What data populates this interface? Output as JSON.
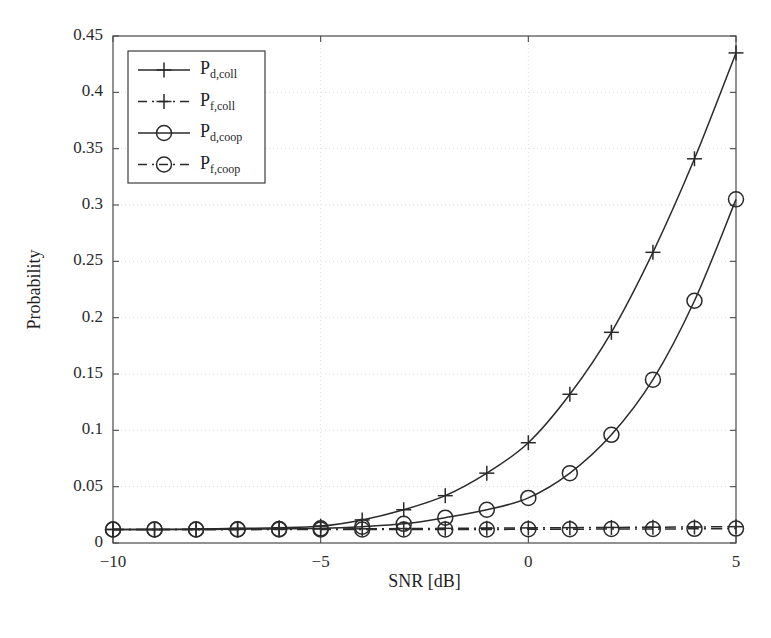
{
  "chart_data": {
    "type": "line",
    "title": "",
    "xlabel": "SNR [dB]",
    "ylabel": "Probability",
    "xlim": [
      -10,
      5
    ],
    "ylim": [
      0,
      0.45
    ],
    "grid": true,
    "legend_position": "top-left",
    "x": [
      -10,
      -9,
      -8,
      -7,
      -6,
      -5,
      -4,
      -3,
      -2,
      -1,
      0,
      1,
      2,
      3,
      4,
      5
    ],
    "xticks": [
      -10,
      -5,
      0,
      5
    ],
    "xticklabels": [
      "−10",
      "−5",
      "0",
      "5"
    ],
    "yticks": [
      0,
      0.05,
      0.1,
      0.15,
      0.2,
      0.25,
      0.3,
      0.35,
      0.4,
      0.45
    ],
    "yticklabels": [
      "0",
      "0.05",
      "0.1",
      "0.15",
      "0.2",
      "0.25",
      "0.3",
      "0.35",
      "0.4",
      "0.45"
    ],
    "series": [
      {
        "name": "P_d,coll",
        "label_base": "P",
        "label_sub": "d,coll",
        "marker": "plus",
        "linestyle": "solid",
        "color": "#2a2a2a",
        "values": [
          0.012,
          0.012,
          0.0125,
          0.013,
          0.0135,
          0.015,
          0.0205,
          0.0295,
          0.042,
          0.062,
          0.089,
          0.132,
          0.187,
          0.258,
          0.341,
          0.435
        ]
      },
      {
        "name": "P_f,coll",
        "label_base": "P",
        "label_sub": "f,coll",
        "marker": "plus",
        "linestyle": "dashdot",
        "color": "#2a2a2a",
        "values": [
          0.012,
          0.012,
          0.012,
          0.012,
          0.0122,
          0.0124,
          0.0126,
          0.0128,
          0.013,
          0.0132,
          0.0134,
          0.0136,
          0.0138,
          0.014,
          0.0142,
          0.0145
        ]
      },
      {
        "name": "P_d,coop",
        "label_base": "P",
        "label_sub": "d,coop",
        "marker": "circle",
        "linestyle": "solid",
        "color": "#2a2a2a",
        "values": [
          0.012,
          0.012,
          0.012,
          0.0122,
          0.0125,
          0.013,
          0.0145,
          0.017,
          0.0225,
          0.0295,
          0.04,
          0.062,
          0.096,
          0.145,
          0.215,
          0.305
        ]
      },
      {
        "name": "P_f,coop",
        "label_base": "P",
        "label_sub": "f,coop",
        "marker": "circle",
        "linestyle": "dashdot",
        "color": "#2a2a2a",
        "values": [
          0.012,
          0.012,
          0.012,
          0.012,
          0.012,
          0.012,
          0.012,
          0.012,
          0.012,
          0.012,
          0.0122,
          0.0122,
          0.0124,
          0.0124,
          0.0126,
          0.0128
        ]
      }
    ]
  }
}
